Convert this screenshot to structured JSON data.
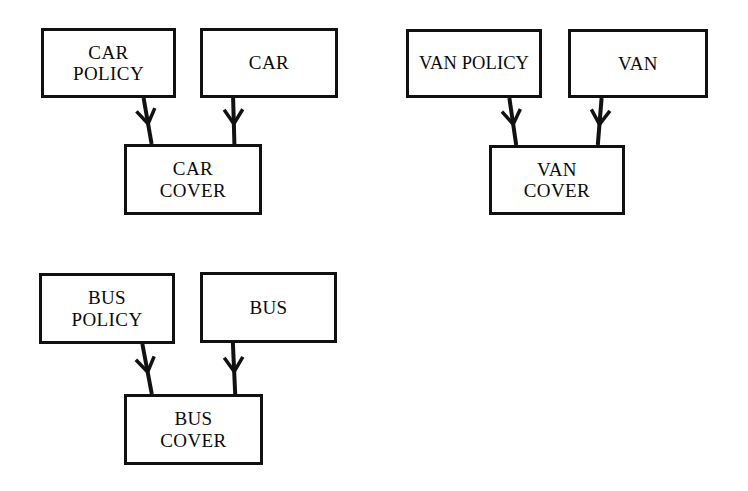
{
  "diagram": {
    "type": "entity-relationship-diagram",
    "background_color": "#ffffff",
    "line_color": "#111111",
    "text_color": "#0a0a0a",
    "groups": [
      {
        "id": "car",
        "name": "Car cover group",
        "parents": [
          {
            "id": "car-policy",
            "label": "CAR\nPOLICY",
            "x": 41,
            "y": 28,
            "w": 135,
            "h": 70
          },
          {
            "id": "car",
            "label": "CAR",
            "x": 200,
            "y": 28,
            "w": 138,
            "h": 70
          }
        ],
        "child": {
          "id": "car-cover",
          "label": "CAR\nCOVER",
          "x": 124,
          "y": 144,
          "w": 138,
          "h": 71
        },
        "edges": [
          {
            "id": "car-policy-to-car-cover",
            "from": "car-policy",
            "to": "car-cover",
            "marker": "barb"
          },
          {
            "id": "car-to-car-cover",
            "from": "car",
            "to": "car-cover",
            "marker": "barb"
          }
        ]
      },
      {
        "id": "van",
        "name": "Van cover group",
        "parents": [
          {
            "id": "van-policy",
            "label": "VAN POLICY",
            "x": 406,
            "y": 29,
            "w": 136,
            "h": 69
          },
          {
            "id": "van",
            "label": "VAN",
            "x": 568,
            "y": 29,
            "w": 140,
            "h": 69
          }
        ],
        "child": {
          "id": "van-cover",
          "label": "VAN\nCOVER",
          "x": 489,
          "y": 145,
          "w": 136,
          "h": 70
        },
        "edges": [
          {
            "id": "van-policy-to-van-cover",
            "from": "van-policy",
            "to": "van-cover",
            "marker": "barb"
          },
          {
            "id": "van-to-van-cover",
            "from": "van",
            "to": "van-cover",
            "marker": "barb"
          }
        ]
      },
      {
        "id": "bus",
        "name": "Bus cover group",
        "parents": [
          {
            "id": "bus-policy",
            "label": "BUS\nPOLICY",
            "x": 39,
            "y": 273,
            "w": 136,
            "h": 71
          },
          {
            "id": "bus",
            "label": "BUS",
            "x": 200,
            "y": 272,
            "w": 137,
            "h": 71
          }
        ],
        "child": {
          "id": "bus-cover",
          "label": "BUS\nCOVER",
          "x": 124,
          "y": 394,
          "w": 139,
          "h": 71
        },
        "edges": [
          {
            "id": "bus-policy-to-bus-cover",
            "from": "bus-policy",
            "to": "bus-cover",
            "marker": "barb"
          },
          {
            "id": "bus-to-bus-cover",
            "from": "bus",
            "to": "bus-cover",
            "marker": "barb"
          }
        ]
      }
    ]
  }
}
